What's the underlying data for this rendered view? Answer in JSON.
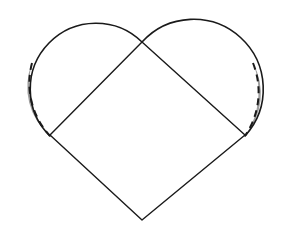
{
  "figure": {
    "canvas": {
      "width": 283,
      "height": 236,
      "background": "#ffffff"
    },
    "colors": {
      "stroke": "#1a1a1a",
      "lune_fill": "#9e9e9e",
      "background": "#ffffff"
    },
    "stroke_widths": {
      "outline": 1.6,
      "square": 1.4,
      "dashed": 2.0
    },
    "square": {
      "label": "inscribed square",
      "orientation_degrees": 45,
      "vertices": [
        {
          "name": "top",
          "x": 142,
          "y": 42
        },
        {
          "name": "right",
          "x": 245,
          "y": 135
        },
        {
          "name": "bottom",
          "x": 142,
          "y": 220
        },
        {
          "name": "left",
          "x": 50,
          "y": 135
        }
      ],
      "side_length": 131,
      "half_diagonal": 94
    },
    "circles": [
      {
        "name": "left-circle",
        "center_x": 90,
        "center_y": 85,
        "radius": 64,
        "arc_start_x": 142,
        "arc_start_y": 42,
        "arc_end_x": 50,
        "arc_end_y": 135,
        "sweep": "clockwise-outer"
      },
      {
        "name": "right-circle",
        "center_x": 195,
        "center_y": 85,
        "radius": 64,
        "arc_start_x": 142,
        "arc_start_y": 42,
        "arc_end_x": 245,
        "arc_end_y": 135,
        "sweep": "counterclockwise-outer"
      }
    ],
    "lunes": [
      {
        "name": "left-lune",
        "fill": "#9e9e9e",
        "outer_arc": "solid circle arc of left-circle",
        "inner_arc": "dashed arc",
        "tip_top_x": 32,
        "tip_top_y": 63,
        "tip_bottom_x": 50,
        "tip_bottom_y": 136
      },
      {
        "name": "right-lune",
        "fill": "#9e9e9e",
        "outer_arc": "solid circle arc of right-circle",
        "inner_arc": "dashed arc",
        "tip_top_x": 253,
        "tip_top_y": 63,
        "tip_bottom_x": 245,
        "tip_bottom_y": 136
      }
    ],
    "dash_pattern": "7 5",
    "intersection_point": {
      "name": "top-cusp",
      "x": 142,
      "y": 42
    }
  }
}
